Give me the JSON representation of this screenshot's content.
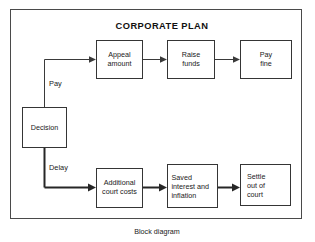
{
  "figure": {
    "title": "CORPORATE PLAN",
    "caption": "Block diagram"
  },
  "diagram": {
    "type": "flowchart",
    "decision": {
      "label_line1": "Decision"
    },
    "branches": [
      {
        "id": "pay",
        "label": "Pay",
        "emphasis": "normal"
      },
      {
        "id": "delay",
        "label": "Delay",
        "emphasis": "bold"
      }
    ],
    "top_path": {
      "branch": "Pay",
      "nodes": [
        {
          "id": "appeal-amount",
          "line1": "Appeal",
          "line2": "amount"
        },
        {
          "id": "raise-funds",
          "line1": "Raise",
          "line2": "funds"
        },
        {
          "id": "pay-fine",
          "line1": "Pay",
          "line2": "fine"
        }
      ]
    },
    "bottom_path": {
      "branch": "Delay",
      "nodes": [
        {
          "id": "additional-court-costs",
          "line1": "Additional",
          "line2": "court costs"
        },
        {
          "id": "saved-interest-inflation",
          "line1": "Saved",
          "line2": "interest and",
          "line3": "inflation"
        },
        {
          "id": "settle-out-of-court",
          "line1": "Settle",
          "line2": "out of",
          "line3": "court"
        }
      ]
    }
  },
  "colors": {
    "background": "#ffffff",
    "ink": "#1a1a1a",
    "box_stroke": "#353535",
    "frame_stroke": "#4a4a4a",
    "connector": "#3a3a3a"
  }
}
